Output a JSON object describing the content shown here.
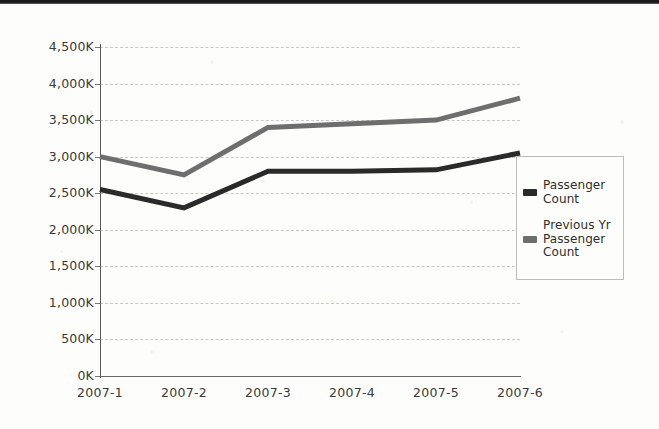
{
  "chart_data": {
    "type": "line",
    "title": "",
    "xlabel": "",
    "ylabel": "",
    "categories": [
      "2007-1",
      "2007-2",
      "2007-3",
      "2007-4",
      "2007-5",
      "2007-6"
    ],
    "series": [
      {
        "name": "Passenger Count",
        "color": "#2a2a2a",
        "values": [
          2550000,
          2300000,
          2800000,
          2800000,
          2820000,
          3050000
        ]
      },
      {
        "name": "Previous Yr Passenger Count",
        "color": "#6e6e6e",
        "values": [
          3000000,
          2750000,
          3400000,
          3450000,
          3500000,
          3800000
        ]
      }
    ],
    "ylim": [
      0,
      4500000
    ],
    "ytick_labels": [
      "4,500K",
      "4,000K",
      "3,500K",
      "3,000K",
      "2,500K",
      "2,000K",
      "1,500K",
      "1,000K",
      "500K",
      "0K"
    ],
    "ytick_values": [
      4500000,
      4000000,
      3500000,
      3000000,
      2500000,
      2000000,
      1500000,
      1000000,
      500000,
      0
    ],
    "grid": true,
    "legend_position": "right"
  },
  "legend": {
    "entries": [
      {
        "label": "Passenger Count",
        "color": "#2a2a2a"
      },
      {
        "label": "Previous Yr Passenger Count",
        "color": "#6e6e6e"
      }
    ]
  }
}
